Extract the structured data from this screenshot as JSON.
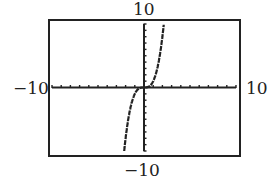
{
  "chart_data": {
    "type": "line",
    "title": "",
    "function": "y = x^3",
    "xlim": [
      -10,
      10
    ],
    "ylim": [
      -10,
      10
    ],
    "xscale": 1,
    "yscale": 1,
    "grid": false,
    "tick_labels": {
      "x_min": "−10",
      "x_max": "10",
      "y_min": "−10",
      "y_max": "10"
    },
    "series": [
      {
        "name": "y = x^3",
        "x": [
          -2.15,
          -2,
          -1.5,
          -1,
          -0.5,
          0,
          0.5,
          1,
          1.5,
          2,
          2.15
        ],
        "y": [
          -10,
          -8,
          -3.375,
          -1,
          -0.125,
          0,
          0.125,
          1,
          3.375,
          8,
          10
        ]
      }
    ]
  },
  "labels": {
    "top": "10",
    "bottom": "−10",
    "left": "−10",
    "right": "10"
  }
}
